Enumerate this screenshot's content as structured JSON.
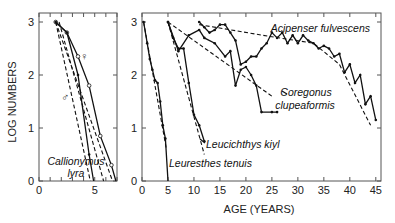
{
  "chart_data": [
    {
      "type": "line",
      "panel": "left",
      "title": "",
      "xlabel": "",
      "ylabel": "LOG NUMBERS",
      "xlim": [
        0,
        7
      ],
      "ylim": [
        0,
        3
      ],
      "x_ticks": [
        0,
        5
      ],
      "y_ticks": [
        0,
        1,
        2,
        3
      ],
      "x_tick_labels": [
        "0",
        "5"
      ],
      "y_tick_labels": [
        "0",
        "1",
        "2",
        "3"
      ],
      "annotations": [
        "Callionymus",
        "lyra",
        "♀",
        "♂"
      ],
      "series": [
        {
          "name": "Callionymus lyra ♀ observed",
          "style": "solid",
          "marker": "open",
          "x": [
            1.5,
            2.5,
            3.5,
            4.5,
            5.5,
            6.5,
            6.9
          ],
          "y": [
            3.0,
            2.8,
            2.35,
            1.8,
            0.85,
            0.3,
            0.0
          ]
        },
        {
          "name": "Callionymus lyra ♀ fitted",
          "style": "dashed",
          "x": [
            1.5,
            6.6
          ],
          "y": [
            3.0,
            0.0
          ]
        },
        {
          "name": "Callionymus lyra ♂ observed",
          "style": "solid",
          "marker": "filled",
          "x": [
            1.5,
            2.5,
            3.5,
            4.5,
            4.9
          ],
          "y": [
            3.0,
            2.8,
            2.0,
            0.5,
            0.0
          ]
        },
        {
          "name": "Callionymus lyra ♂ fitted",
          "style": "dashed",
          "x": [
            1.5,
            4.6
          ],
          "y": [
            3.0,
            0.0
          ]
        },
        {
          "name": "Callionymus lyra ♂ fitted 2",
          "style": "dashed",
          "x": [
            1.8,
            5.8
          ],
          "y": [
            3.0,
            0.0
          ]
        }
      ]
    },
    {
      "type": "line",
      "panel": "right",
      "title": "",
      "xlabel": "AGE (YEARS)",
      "ylabel": "",
      "xlim": [
        0,
        46
      ],
      "ylim": [
        0,
        3
      ],
      "x_ticks": [
        0,
        5,
        10,
        15,
        20,
        25,
        30,
        35,
        40,
        45
      ],
      "y_ticks": [
        0,
        1,
        2,
        3
      ],
      "x_tick_labels": [
        "0",
        "5",
        "10",
        "15",
        "20",
        "25",
        "30",
        "35",
        "40",
        "45"
      ],
      "y_tick_labels": [
        "0",
        "1",
        "2",
        "3"
      ],
      "annotations": [
        "Acipenser fulvescens",
        "Coregonus",
        "clupeaformis",
        "Leucichthys kiyl",
        "Leuresthes tenuis"
      ],
      "series": [
        {
          "name": "Leuresthes tenuis observed",
          "style": "solid",
          "marker": "filled",
          "x": [
            0.3,
            1,
            1.5,
            2,
            2.5,
            3,
            3.5,
            4,
            4.5,
            5
          ],
          "y": [
            3.0,
            2.6,
            2.3,
            2.1,
            1.9,
            1.85,
            1.5,
            1.05,
            0.8,
            0.0
          ]
        },
        {
          "name": "Leuresthes tenuis fitted",
          "style": "dashed",
          "x": [
            0.3,
            4.7
          ],
          "y": [
            3.0,
            0.6
          ]
        },
        {
          "name": "Leucichthys kiyl observed",
          "style": "solid",
          "marker": "filled",
          "x": [
            5,
            6,
            7,
            8,
            9,
            10,
            11,
            12
          ],
          "y": [
            3.0,
            2.7,
            2.5,
            2.5,
            1.85,
            1.25,
            1.05,
            0.75
          ]
        },
        {
          "name": "Leucichthys kiyl fitted",
          "style": "dashed",
          "x": [
            5,
            12
          ],
          "y": [
            3.0,
            0.5
          ]
        },
        {
          "name": "Coregonus clupeaformis observed",
          "style": "solid",
          "marker": "filled",
          "x": [
            5,
            7,
            9,
            11,
            12,
            14,
            16,
            17,
            18,
            19,
            20,
            21,
            22,
            23,
            25,
            26
          ],
          "y": [
            3.0,
            2.45,
            2.75,
            2.85,
            2.7,
            2.6,
            2.35,
            2.45,
            1.8,
            2.1,
            2.15,
            2.0,
            1.8,
            1.3,
            1.3,
            1.3
          ]
        },
        {
          "name": "Coregonus clupeaformis fitted",
          "style": "dashed",
          "x": [
            5,
            25
          ],
          "y": [
            3.0,
            1.6
          ]
        },
        {
          "name": "Acipenser fulvescens observed",
          "style": "solid",
          "marker": "filled",
          "x": [
            11,
            12,
            13,
            14,
            15,
            16,
            17,
            18,
            19,
            20,
            21,
            22,
            23,
            24,
            25,
            26,
            27,
            28,
            29,
            30,
            31,
            32,
            33,
            34,
            35,
            36,
            37,
            38,
            39,
            40,
            41,
            42,
            43,
            44,
            45
          ],
          "y": [
            3.0,
            2.9,
            2.8,
            2.85,
            2.95,
            2.95,
            2.8,
            2.65,
            2.2,
            2.25,
            2.35,
            2.35,
            2.5,
            2.6,
            2.8,
            2.7,
            2.8,
            2.6,
            2.75,
            2.6,
            2.75,
            2.65,
            2.6,
            2.5,
            2.55,
            2.5,
            2.35,
            2.4,
            2.05,
            2.2,
            1.85,
            2.0,
            1.45,
            1.6,
            1.15
          ]
        },
        {
          "name": "Acipenser fulvescens fitted",
          "style": "dashed",
          "x": [
            11,
            25,
            33,
            38,
            44
          ],
          "y": [
            2.95,
            2.72,
            2.6,
            2.2,
            1.05
          ]
        }
      ]
    }
  ]
}
